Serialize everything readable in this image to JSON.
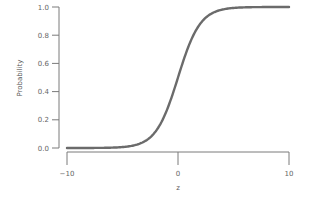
{
  "chart_data": {
    "type": "line",
    "title": "",
    "xlabel": "z",
    "ylabel": "Probability",
    "xlim": [
      -10,
      10
    ],
    "ylim": [
      0,
      1
    ],
    "x_ticks": [
      -10,
      0,
      10
    ],
    "x_tick_labels": [
      "−10",
      "0",
      "10"
    ],
    "y_ticks": [
      0.0,
      0.2,
      0.4,
      0.6,
      0.8,
      1.0
    ],
    "y_tick_labels": [
      "0.0",
      "0.2",
      "0.4",
      "0.6",
      "0.8",
      "1.0"
    ],
    "grid": false,
    "legend": null,
    "series": [
      {
        "name": "logistic sigmoid",
        "function": "1/(1+exp(-z))",
        "x": [
          -10,
          -8,
          -6,
          -4,
          -3,
          -2,
          -1,
          0,
          1,
          2,
          3,
          4,
          6,
          8,
          10
        ],
        "values": [
          0.0,
          0.0003,
          0.0025,
          0.018,
          0.047,
          0.119,
          0.269,
          0.5,
          0.731,
          0.881,
          0.953,
          0.982,
          0.9975,
          0.9997,
          1.0
        ]
      }
    ]
  },
  "colors": {
    "curve": "#6b6b6b",
    "axis": "#7a7a7a",
    "text": "#666666"
  }
}
